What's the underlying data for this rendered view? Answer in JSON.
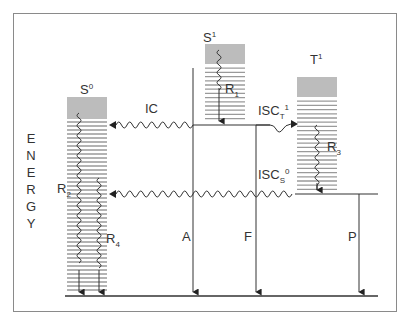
{
  "diagram": {
    "type": "jablonski-energy-diagram",
    "axis_label": "ENERGY",
    "axis_letters": [
      "E",
      "N",
      "E",
      "R",
      "G",
      "Y"
    ],
    "states": [
      {
        "id": "S0",
        "base": "S",
        "sup": "0"
      },
      {
        "id": "S1",
        "base": "S",
        "sup": "1"
      },
      {
        "id": "T1",
        "base": "T",
        "sup": "1"
      }
    ],
    "transitions": {
      "IC": {
        "label": "IC"
      },
      "ISC_T": {
        "base": "ISC",
        "sub": "T",
        "sup": "1"
      },
      "ISC_S": {
        "base": "ISC",
        "sub": "S",
        "sup": "0"
      },
      "A": {
        "label": "A"
      },
      "F": {
        "label": "F"
      },
      "P": {
        "label": "P"
      },
      "R1": {
        "base": "R",
        "sub": "1"
      },
      "R2": {
        "base": "R",
        "sub": "2"
      },
      "R3": {
        "base": "R",
        "sub": "3"
      },
      "R4": {
        "base": "R",
        "sub": "4"
      }
    },
    "colors": {
      "frame": "#8a8a8a",
      "line": "#333333",
      "level_dark": "#7a7a7a",
      "level_light": "#9a9a9a"
    }
  }
}
